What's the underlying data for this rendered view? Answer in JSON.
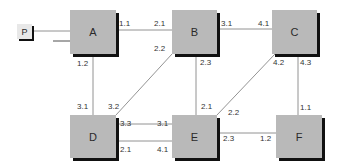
{
  "diagram": {
    "nodes": [
      {
        "id": "P",
        "label": "P",
        "x": 17,
        "y": 24,
        "w": 15,
        "h": 15,
        "kind": "source"
      },
      {
        "id": "A",
        "label": "A",
        "x": 70,
        "y": 10,
        "w": 46,
        "h": 44
      },
      {
        "id": "B",
        "label": "B",
        "x": 172,
        "y": 10,
        "w": 45,
        "h": 44
      },
      {
        "id": "C",
        "label": "C",
        "x": 272,
        "y": 10,
        "w": 45,
        "h": 44
      },
      {
        "id": "D",
        "label": "D",
        "x": 70,
        "y": 115,
        "w": 46,
        "h": 43
      },
      {
        "id": "E",
        "label": "E",
        "x": 172,
        "y": 115,
        "w": 45,
        "h": 43
      },
      {
        "id": "F",
        "label": "F",
        "x": 276,
        "y": 115,
        "w": 46,
        "h": 43
      }
    ],
    "edges": [
      {
        "from": "P",
        "to": "A",
        "from_port": "",
        "to_port": ""
      },
      {
        "from": "A",
        "to": "B",
        "from_port": "1.1",
        "to_port": "2.1"
      },
      {
        "from": "A",
        "to": "D",
        "from_port": "1.2",
        "to_port": "3.1"
      },
      {
        "from": "B",
        "to": "C",
        "from_port": "3.1",
        "to_port": "4.1"
      },
      {
        "from": "B",
        "to": "D",
        "from_port": "2.2",
        "to_port": "3.2"
      },
      {
        "from": "B",
        "to": "E",
        "from_port": "2.3",
        "to_port": "2.1"
      },
      {
        "from": "C",
        "to": "E",
        "from_port": "4.2",
        "to_port": "2.2"
      },
      {
        "from": "C",
        "to": "F",
        "from_port": "4.3",
        "to_port": "1.1"
      },
      {
        "from": "D",
        "to": "E",
        "from_port": "3.3",
        "to_port": "3.1"
      },
      {
        "from": "D",
        "to": "E",
        "from_port": "2.1",
        "to_port": "4.1"
      },
      {
        "from": "E",
        "to": "F",
        "from_port": "2.3",
        "to_port": "1.2"
      }
    ],
    "port_labels": [
      {
        "text": "1.1",
        "x": 119,
        "y": 20
      },
      {
        "text": "2.1",
        "x": 154,
        "y": 20
      },
      {
        "text": "2.2",
        "x": 154,
        "y": 45
      },
      {
        "text": "1.2",
        "x": 77,
        "y": 60
      },
      {
        "text": "3.1",
        "x": 221,
        "y": 20
      },
      {
        "text": "4.1",
        "x": 258,
        "y": 20
      },
      {
        "text": "2.3",
        "x": 200,
        "y": 59
      },
      {
        "text": "4.2",
        "x": 273,
        "y": 59
      },
      {
        "text": "4.3",
        "x": 300,
        "y": 59
      },
      {
        "text": "3.1",
        "x": 77,
        "y": 103
      },
      {
        "text": "3.2",
        "x": 108,
        "y": 103
      },
      {
        "text": "3.3",
        "x": 120,
        "y": 120
      },
      {
        "text": "3.1",
        "x": 157,
        "y": 120
      },
      {
        "text": "2.1",
        "x": 120,
        "y": 146
      },
      {
        "text": "4.1",
        "x": 157,
        "y": 146
      },
      {
        "text": "2.1",
        "x": 201,
        "y": 103
      },
      {
        "text": "2.2",
        "x": 228,
        "y": 109
      },
      {
        "text": "2.3",
        "x": 223,
        "y": 135
      },
      {
        "text": "1.2",
        "x": 260,
        "y": 135
      },
      {
        "text": "1.1",
        "x": 300,
        "y": 104
      }
    ],
    "colors": {
      "node_fill": "#b9b9b9",
      "shadow": "#111111",
      "line": "#555555"
    }
  }
}
